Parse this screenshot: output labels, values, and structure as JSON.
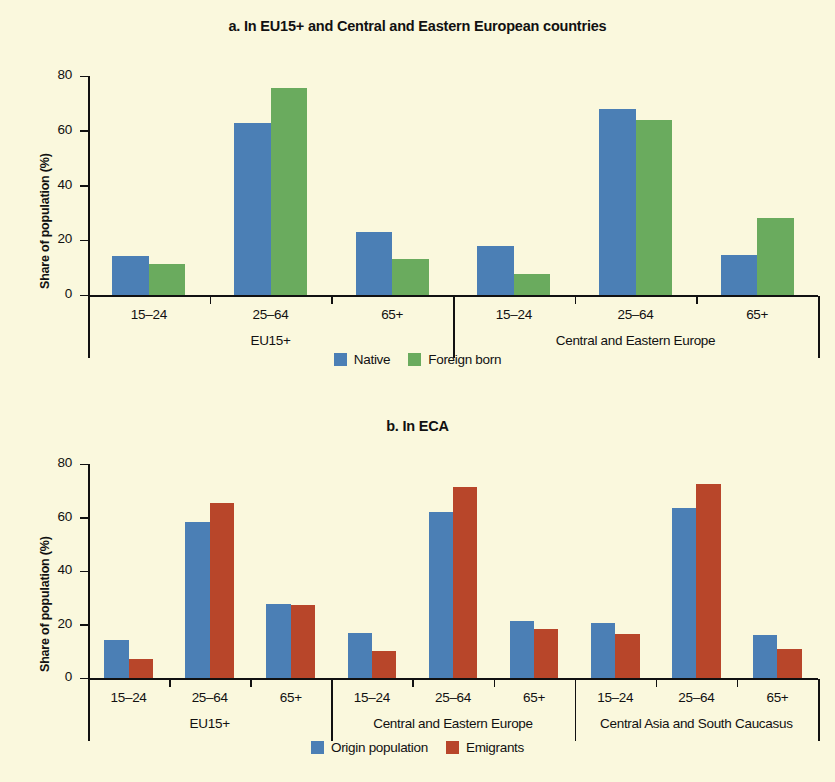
{
  "figure": {
    "background_color": "#faf8dd",
    "ylabel": "Share of population (%)",
    "yticks": [
      "0",
      "20",
      "40",
      "60",
      "80"
    ],
    "colors": {
      "native": "#4b7fb5",
      "foreign_born": "#6aab5e",
      "origin_population": "#4b7fb5",
      "emigrants": "#b8462a"
    }
  },
  "panel_a": {
    "title": "a. In EU15+ and Central and Eastern European countries",
    "ylabel": "Share of population (%)",
    "legend": [
      {
        "label": "Native",
        "color": "#4b7fb5"
      },
      {
        "label": "Foreign born",
        "color": "#6aab5e"
      }
    ],
    "groups": [
      {
        "name": "EU15+",
        "categories": [
          "15–24",
          "25–64",
          "65+"
        ]
      },
      {
        "name": "Central and Eastern Europe",
        "categories": [
          "15–24",
          "25–64",
          "65+"
        ]
      }
    ]
  },
  "panel_b": {
    "title": "b. In ECA",
    "ylabel": "Share of population (%)",
    "legend": [
      {
        "label": "Origin population",
        "color": "#4b7fb5"
      },
      {
        "label": "Emigrants",
        "color": "#b8462a"
      }
    ],
    "groups": [
      {
        "name": "EU15+",
        "categories": [
          "15–24",
          "25–64",
          "65+"
        ]
      },
      {
        "name": "Central and Eastern Europe",
        "categories": [
          "15–24",
          "25–64",
          "65+"
        ]
      },
      {
        "name": "Central Asia and South Caucasus",
        "categories": [
          "15–24",
          "25–64",
          "65+"
        ]
      }
    ]
  },
  "chart_data": [
    {
      "type": "bar",
      "title": "a. In EU15+ and Central and Eastern European countries",
      "xlabel": "",
      "ylabel": "Share of population (%)",
      "ylim": [
        0,
        80
      ],
      "yticks": [
        0,
        20,
        40,
        60,
        80
      ],
      "grid": false,
      "legend_position": "bottom",
      "categories": [
        "EU15+ / 15–24",
        "EU15+ / 25–64",
        "EU15+ / 65+",
        "Central and Eastern Europe / 15–24",
        "Central and Eastern Europe / 25–64",
        "Central and Eastern Europe / 65+"
      ],
      "group_labels": [
        "EU15+",
        "Central and Eastern Europe"
      ],
      "age_labels": [
        "15–24",
        "25–64",
        "65+"
      ],
      "series": [
        {
          "name": "Native",
          "color": "#4b7fb5",
          "values": [
            14.2,
            63.0,
            23.0,
            18.0,
            68.0,
            14.5
          ]
        },
        {
          "name": "Foreign born",
          "color": "#6aab5e",
          "values": [
            11.5,
            75.5,
            13.0,
            7.5,
            64.0,
            28.0
          ]
        }
      ]
    },
    {
      "type": "bar",
      "title": "b. In ECA",
      "xlabel": "",
      "ylabel": "Share of population (%)",
      "ylim": [
        0,
        80
      ],
      "yticks": [
        0,
        20,
        40,
        60,
        80
      ],
      "grid": false,
      "legend_position": "bottom",
      "categories": [
        "EU15+ / 15–24",
        "EU15+ / 25–64",
        "EU15+ / 65+",
        "Central and Eastern Europe / 15–24",
        "Central and Eastern Europe / 25–64",
        "Central and Eastern Europe / 65+",
        "Central Asia and South Caucasus / 15–24",
        "Central Asia and South Caucasus / 25–64",
        "Central Asia and South Caucasus / 65+"
      ],
      "group_labels": [
        "EU15+",
        "Central and Eastern Europe",
        "Central Asia and South Caucasus"
      ],
      "age_labels": [
        "15–24",
        "25–64",
        "65+"
      ],
      "series": [
        {
          "name": "Origin population",
          "color": "#4b7fb5",
          "values": [
            14.2,
            58.5,
            27.5,
            16.8,
            62.0,
            21.2,
            20.5,
            63.5,
            16.0
          ]
        },
        {
          "name": "Emigrants",
          "color": "#b8462a",
          "values": [
            7.0,
            65.5,
            27.4,
            10.2,
            71.5,
            18.5,
            16.5,
            72.5,
            11.0
          ]
        }
      ]
    }
  ]
}
